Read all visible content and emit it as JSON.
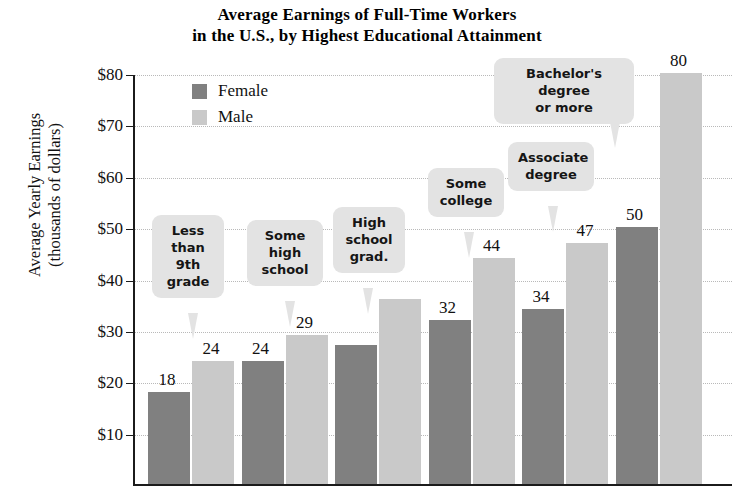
{
  "chart_data": {
    "type": "bar",
    "title": "Average Earnings of Full-Time Workers in the U.S., by Highest Educational Attainment",
    "title_lines": [
      "Average Earnings of Full-Time Workers",
      "in the U.S., by Highest Educational Attainment"
    ],
    "xlabel": "",
    "ylabel": "Average Yearly Earnings (thousands of dollars)",
    "ylabel_lines": [
      "Average Yearly Earnings",
      "(thousands of dollars)"
    ],
    "categories": [
      "Less than 9th grade",
      "Some high school",
      "High school grad.",
      "Some college",
      "Associate degree",
      "Bachelor's degree or more"
    ],
    "category_labels_wrapped": [
      "Less\nthan\n9th\ngrade",
      "Some\nhigh\nschool",
      "High\nschool\ngrad.",
      "Some\ncollege",
      "Associate\ndegree",
      "Bachelor's degree\nor more"
    ],
    "series": [
      {
        "name": "Female",
        "color": "#808080",
        "values": [
          18,
          24,
          27,
          32,
          34,
          50
        ]
      },
      {
        "name": "Male",
        "color": "#c9c9c9",
        "values": [
          24,
          29,
          36,
          44,
          47,
          80
        ]
      }
    ],
    "value_labels": {
      "female": [
        "18",
        "24",
        "",
        "32",
        "34",
        "50"
      ],
      "male": [
        "24",
        "29",
        "",
        "44",
        "47",
        "80"
      ]
    },
    "ylim": [
      0,
      80
    ],
    "ytick_values": [
      80,
      70,
      60,
      50,
      40,
      30,
      20,
      10
    ],
    "ytick_labels": [
      "$80",
      "$70",
      "$60",
      "$50",
      "$40",
      "$30",
      "$20",
      "$10"
    ],
    "grid": true,
    "legend_position": "upper-left-inside"
  },
  "legend": {
    "items": [
      {
        "label": "Female",
        "swatch": "female-swatch"
      },
      {
        "label": "Male",
        "swatch": "male-swatch"
      }
    ]
  },
  "callouts": [
    {
      "text": "Less\nthan\n9th\ngrade"
    },
    {
      "text": "Some\nhigh\nschool"
    },
    {
      "text": "High\nschool\ngrad."
    },
    {
      "text": "Some\ncollege"
    },
    {
      "text": "Associate\ndegree"
    },
    {
      "text": "Bachelor's degree\nor more"
    }
  ]
}
